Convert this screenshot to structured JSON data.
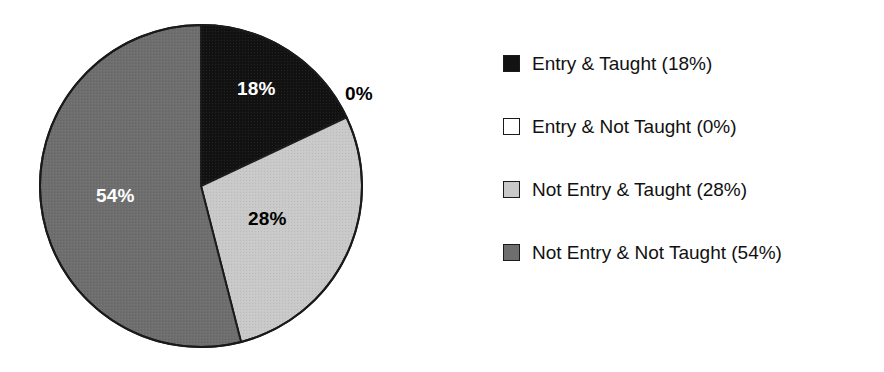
{
  "chart_data": {
    "type": "pie",
    "title": "",
    "subtitle": "",
    "xlabel": "",
    "ylabel": "",
    "legend_position": "right",
    "grid": false,
    "categories": [
      "Entry & Taught",
      "Entry & Not Taught",
      "Not Entry & Taught",
      "Not Entry & Not Taught"
    ],
    "values": [
      18,
      0,
      28,
      54
    ],
    "unit": "%",
    "start_angle_deg": 0,
    "direction": "clockwise",
    "slices": [
      {
        "label": "Entry & Taught",
        "value": 18,
        "value_text": "18%",
        "legend_text": "Entry & Taught (18%)",
        "color": "#121212",
        "label_color": "#ffffff",
        "start_deg": 0,
        "end_deg": 64.8
      },
      {
        "label": "Entry & Not Taught",
        "value": 0,
        "value_text": "0%",
        "legend_text": "Entry & Not Taught (0%)",
        "color": "#ffffff",
        "label_color": "#000000",
        "start_deg": 64.8,
        "end_deg": 64.8
      },
      {
        "label": "Not Entry & Taught",
        "value": 28,
        "value_text": "28%",
        "legend_text": "Not Entry & Taught (28%)",
        "color": "#c9c9c9",
        "label_color": "#000000",
        "start_deg": 64.8,
        "end_deg": 165.6
      },
      {
        "label": "Not Entry & Not Taught",
        "value": 54,
        "value_text": "54%",
        "legend_text": "Not Entry & Not Taught (54%)",
        "color": "#6e6e6e",
        "label_color": "#ffffff",
        "start_deg": 165.6,
        "end_deg": 360
      }
    ]
  },
  "pie": {
    "labels": {
      "slice_entry_taught": "18%",
      "slice_entry_not_taught": "0%",
      "slice_not_entry_taught": "28%",
      "slice_not_entry_not_taught": "54%"
    }
  },
  "legend": {
    "items": [
      {
        "text": "Entry & Taught (18%)",
        "swatch": "#121212"
      },
      {
        "text": "Entry & Not Taught (0%)",
        "swatch": "#ffffff"
      },
      {
        "text": "Not Entry & Taught (28%)",
        "swatch": "#c9c9c9"
      },
      {
        "text": "Not Entry & Not Taught (54%)",
        "swatch": "#6e6e6e"
      }
    ]
  },
  "colors": {
    "background": "#ffffff",
    "outline": "#1a1a1a",
    "text": "#111111",
    "black_slice": "#121212",
    "white_slice": "#ffffff",
    "light_gray_slice": "#c9c9c9",
    "dark_gray_slice": "#6e6e6e"
  }
}
